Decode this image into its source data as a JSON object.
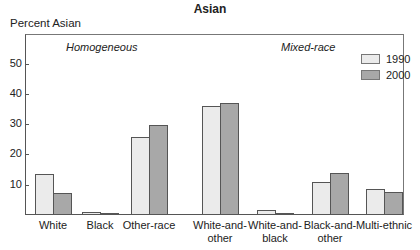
{
  "chart_data": {
    "type": "bar",
    "title": "Asian",
    "ylabel": "Percent Asian",
    "xlabel": "",
    "ylim": [
      0,
      60
    ],
    "yticks": [
      10,
      20,
      30,
      40,
      50
    ],
    "grid": false,
    "legend_position": "top-right",
    "annotations": [
      "Homogeneous",
      "Mixed-race"
    ],
    "categories": [
      "White",
      "Black",
      "Other-race",
      "White-and-other",
      "White-and-black",
      "Black-and-other",
      "Multi-ethnic"
    ],
    "category_labels": [
      [
        "White"
      ],
      [
        "Black"
      ],
      [
        "Other-race"
      ],
      [
        "White-and-",
        "other"
      ],
      [
        "White-and-",
        "black"
      ],
      [
        "Black-and-",
        "other"
      ],
      [
        "Multi-ethnic"
      ]
    ],
    "series": [
      {
        "name": "1990",
        "color": "#ebebeb",
        "values": [
          13.5,
          1.0,
          25.7,
          36.0,
          1.7,
          11.0,
          8.5
        ]
      },
      {
        "name": "2000",
        "color": "#a8a8a8",
        "values": [
          7.3,
          0.7,
          29.7,
          37.0,
          0.8,
          13.8,
          7.5
        ]
      }
    ]
  }
}
